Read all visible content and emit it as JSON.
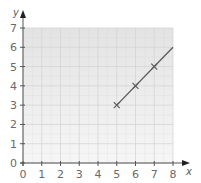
{
  "chart_data": {
    "type": "line",
    "title": "",
    "xlabel": "x",
    "ylabel": "y",
    "xlim": [
      0,
      8
    ],
    "ylim": [
      0,
      7
    ],
    "x_ticks": [
      0,
      1,
      2,
      3,
      4,
      5,
      6,
      7,
      8
    ],
    "y_ticks": [
      0,
      1,
      2,
      3,
      4,
      5,
      6,
      7
    ],
    "grid": true,
    "legend": null,
    "series": [
      {
        "name": "line",
        "x": [
          5,
          8
        ],
        "y": [
          3,
          6
        ],
        "color": "#5a5a5a"
      }
    ],
    "markers": {
      "style": "x",
      "x": [
        5,
        6,
        7
      ],
      "y": [
        3,
        4,
        5
      ]
    }
  },
  "colors": {
    "grid_top": "#e3e3e3",
    "grid_bottom": "#f6f6f6",
    "grid_line": "#d2d2d2",
    "axis": "#555555",
    "line": "#5a5a5a"
  }
}
